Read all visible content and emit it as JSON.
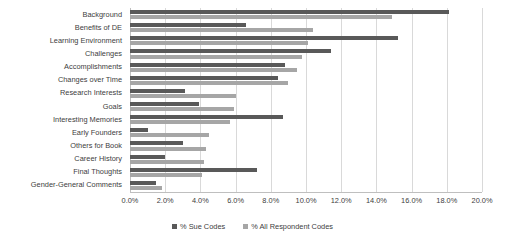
{
  "chart_data": {
    "type": "bar",
    "orientation": "horizontal",
    "title": "",
    "xlabel": "",
    "ylabel": "",
    "xlim": [
      0,
      20
    ],
    "xtick_labels": [
      "0.0%",
      "2.0%",
      "4.0%",
      "6.0%",
      "8.0%",
      "10.0%",
      "12.0%",
      "14.0%",
      "16.0%",
      "18.0%",
      "20.0%"
    ],
    "xticks": [
      0,
      2,
      4,
      6,
      8,
      10,
      12,
      14,
      16,
      18,
      20
    ],
    "grid": true,
    "legend_position": "bottom",
    "categories": [
      "Background",
      "Benefits of DE",
      "Learning Environment",
      "Challenges",
      "Accomplishments",
      "Changes over Time",
      "Research Interests",
      "Goals",
      "Interesting Memories",
      "Early Founders",
      "Others for Book",
      "Career History",
      "Final Thoughts",
      "Gender-General Comments"
    ],
    "series": [
      {
        "name": "% Sue Codes",
        "color": "#595959",
        "values": [
          18.1,
          6.6,
          15.2,
          11.4,
          8.8,
          8.4,
          3.1,
          3.9,
          8.7,
          1.0,
          3.0,
          2.0,
          7.2,
          1.5
        ]
      },
      {
        "name": "% All Respondent Codes",
        "color": "#a6a6a6",
        "values": [
          14.9,
          10.4,
          10.1,
          9.8,
          9.5,
          9.0,
          6.0,
          5.9,
          5.7,
          4.5,
          4.3,
          4.2,
          4.1,
          1.8
        ]
      }
    ]
  },
  "legend": {
    "items": [
      {
        "label": "% Sue Codes",
        "swatch": "sue"
      },
      {
        "label": "% All Respondent Codes",
        "swatch": "all"
      }
    ]
  }
}
